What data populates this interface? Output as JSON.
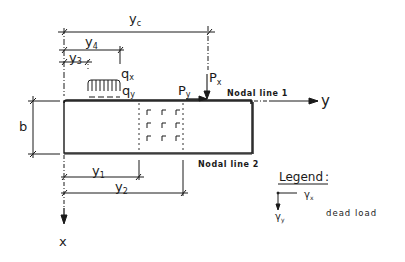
{
  "diagram": {
    "dimensions": {
      "yc": "y",
      "yc_sub": "c",
      "y4": "y",
      "y4_sub": "4",
      "y3": "y",
      "y3_sub": "3",
      "y1": "y",
      "y1_sub": "1",
      "y2": "y",
      "y2_sub": "2",
      "b": "b"
    },
    "loads": {
      "qx": "q",
      "qx_sub": "x",
      "qy": "q",
      "qy_sub": "y",
      "px": "P",
      "px_sub": "x",
      "py": "P",
      "py_sub": "y"
    },
    "axes": {
      "y_axis": "y",
      "x_axis": "x"
    },
    "nodal_lines": {
      "line1": "Nodal line 1",
      "line2": "Nodal line 2"
    },
    "legend": {
      "title": "Legend",
      "colon": ":",
      "gamma_x": "γ",
      "gamma_x_sub": "x",
      "gamma_y": "γ",
      "gamma_y_sub": "y",
      "description": "dead load"
    },
    "colors": {
      "ink": "#1a1a1a",
      "background": "#ffffff"
    }
  }
}
